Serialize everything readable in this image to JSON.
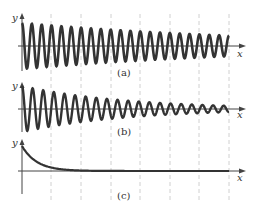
{
  "figure": {
    "panels": [
      {
        "id": "a",
        "caption": "(a)",
        "x_label": "x",
        "y_label": "y",
        "description": "slowly damped oscillation"
      },
      {
        "id": "b",
        "caption": "(b)",
        "x_label": "x",
        "y_label": "y",
        "description": "more strongly damped oscillation"
      },
      {
        "id": "c",
        "caption": "(c)",
        "x_label": "x",
        "y_label": "y",
        "description": "exponential decay, no oscillation"
      }
    ],
    "colors": {
      "curve": "#333333",
      "axis": "#444444",
      "grid": "#bbbbbb"
    }
  }
}
